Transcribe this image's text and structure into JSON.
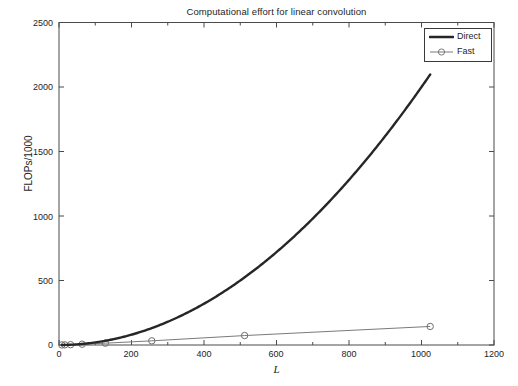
{
  "chart_data": {
    "type": "line",
    "title": "Computational effort for linear convolution",
    "xlabel": "L",
    "ylabel": "FLOPs/1000",
    "xlim": [
      0,
      1200
    ],
    "ylim": [
      0,
      2500
    ],
    "xticks": [
      0,
      200,
      400,
      600,
      800,
      1000,
      1200
    ],
    "yticks": [
      0,
      500,
      1000,
      1500,
      2000,
      2500
    ],
    "grid": false,
    "legend_position": "top-right",
    "series": [
      {
        "name": "Direct",
        "style": "thick-solid-black",
        "color": "#1a1a1a",
        "marker": "none",
        "x": [
          8,
          16,
          32,
          64,
          128,
          256,
          512,
          1024
        ],
        "y": [
          0.13,
          0.51,
          2.05,
          8.2,
          32.8,
          131,
          524,
          2097
        ]
      },
      {
        "name": "Fast",
        "style": "thin-solid-gray-with-circles",
        "color": "#6e6e6e",
        "marker": "circle",
        "x": [
          8,
          16,
          32,
          64,
          128,
          256,
          512,
          1024
        ],
        "y": [
          0.4,
          1.1,
          2.6,
          6.1,
          14.1,
          32.3,
          73.2,
          143.7
        ]
      }
    ]
  },
  "legend": {
    "items": [
      {
        "label": "Direct"
      },
      {
        "label": "Fast"
      }
    ]
  },
  "axes": {
    "y_tick_labels": [
      "2500",
      "2000",
      "1500",
      "1000",
      "500",
      "0"
    ],
    "x_tick_labels": [
      "0",
      "200",
      "400",
      "600",
      "800",
      "1000",
      "1200"
    ]
  }
}
